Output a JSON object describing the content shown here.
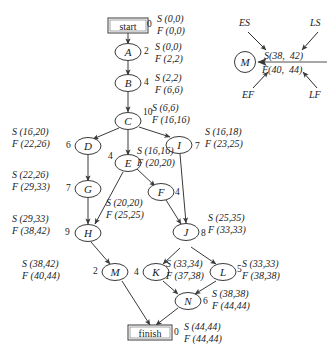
{
  "diagram": {
    "terminal_nodes": {
      "start": {
        "label": "start",
        "duration": "0",
        "S": "S (0,0)",
        "F": "F (0,0)"
      },
      "finish": {
        "label": "finish",
        "duration": "0",
        "S": "S (44,44)",
        "F": "F (44,44)"
      }
    },
    "nodes": [
      {
        "id": "A",
        "label": "A",
        "duration": "2",
        "S": "S (0,0)",
        "F": "F (2,2)"
      },
      {
        "id": "B",
        "label": "B",
        "duration": "4",
        "S": "S (2,2)",
        "F": "F (6,6)"
      },
      {
        "id": "C",
        "label": "C",
        "duration": "10",
        "S": "S (6,6)",
        "F": "F (16,16)"
      },
      {
        "id": "D",
        "label": "D",
        "duration": "6",
        "S": "S (16,20)",
        "F": "F (22,26)"
      },
      {
        "id": "E",
        "label": "E",
        "duration": "4",
        "S": "S (16,16)",
        "F": "F (20,20)"
      },
      {
        "id": "F",
        "label": "F",
        "duration": "4",
        "S": "S (20,20)",
        "F": "F (25,25)"
      },
      {
        "id": "G",
        "label": "G",
        "duration": "7",
        "S": "S (22,26)",
        "F": "F (29,33)"
      },
      {
        "id": "H",
        "label": "H",
        "duration": "9",
        "S": "S (29,33)",
        "F": "F (38,42)"
      },
      {
        "id": "I",
        "label": "I",
        "duration": "7",
        "S": "S (16,18)",
        "F": "F (23,25)"
      },
      {
        "id": "J",
        "label": "J",
        "duration": "8",
        "S": "S (25,35)",
        "F": "F (33,33)"
      },
      {
        "id": "K",
        "label": "K",
        "duration": "4",
        "S": "S (33,34)",
        "F": "F (37,38)"
      },
      {
        "id": "L",
        "label": "L",
        "duration": "5",
        "S": "S (33,33)",
        "F": "F (38,38)"
      },
      {
        "id": "M",
        "label": "M",
        "duration": "2",
        "S": "S (38,42)",
        "F": "F (40,44)"
      },
      {
        "id": "N",
        "label": "N",
        "duration": "6",
        "S": "S (38,38)",
        "F": "F (44,44)"
      }
    ],
    "edges": [
      "start->A",
      "A->B",
      "B->C",
      "C->D",
      "C->E",
      "C->I",
      "D->G",
      "E->F",
      "E->H",
      "F->J",
      "I->J",
      "G->H",
      "H->M",
      "J->K",
      "J->L",
      "K->N",
      "L->N",
      "M->finish",
      "N->finish"
    ]
  },
  "legend": {
    "node_label": "M",
    "s_line": "S(38,  42)",
    "f_line": "F(40,  44)",
    "annotations": {
      "es": "ES",
      "ls": "LS",
      "ef": "EF",
      "lf": "LF"
    }
  },
  "colors": {
    "stroke": "#3a3a3a",
    "text": "#1b1b1b",
    "background": "#ffffff"
  }
}
